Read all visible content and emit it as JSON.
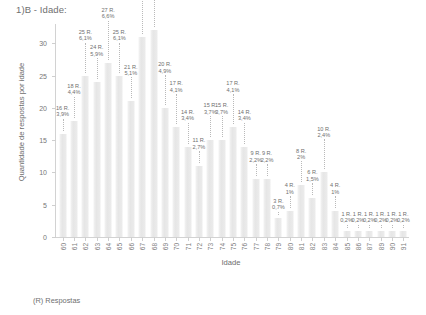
{
  "page": {
    "title": "1)B - Idade:",
    "footer_note": "(R) Respostas"
  },
  "chart_data": {
    "type": "bar",
    "title": "1)B - Idade:",
    "xlabel": "Idade",
    "ylabel": "Quantidade de respostas por idade",
    "ylim": [
      0,
      33
    ],
    "yticks": [
      0,
      5,
      10,
      15,
      20,
      25,
      30
    ],
    "grid": false,
    "legend": null,
    "categories": [
      "60",
      "61",
      "62",
      "63",
      "64",
      "65",
      "66",
      "67",
      "68",
      "69",
      "70",
      "71",
      "72",
      "73",
      "74",
      "75",
      "76",
      "77",
      "78",
      "79",
      "80",
      "81",
      "82",
      "83",
      "84",
      "85",
      "86",
      "87",
      "89",
      "90",
      "91"
    ],
    "values": [
      16,
      18,
      25,
      24,
      27,
      25,
      21,
      31,
      32,
      20,
      17,
      14,
      11,
      15,
      15,
      17,
      14,
      9,
      9,
      3,
      4,
      8,
      6,
      10,
      4,
      1,
      1,
      1,
      1,
      1,
      1
    ],
    "labels": [
      {
        "count": "16 R.",
        "pct": "3,9%"
      },
      {
        "count": "18 R.",
        "pct": "4,4%"
      },
      {
        "count": "25 R.",
        "pct": "6,1%"
      },
      {
        "count": "24 R.",
        "pct": "5,9%"
      },
      {
        "count": "27 R.",
        "pct": "6,6%"
      },
      {
        "count": "25 R.",
        "pct": "6,1%"
      },
      {
        "count": "21 R.",
        "pct": "5,1%"
      },
      {
        "count": "31 R.",
        "pct": "7,6%"
      },
      {
        "count": "32 R.",
        "pct": "7,8%"
      },
      {
        "count": "20 R.",
        "pct": "4,9%"
      },
      {
        "count": "17 R.",
        "pct": "4,1%"
      },
      {
        "count": "14 R.",
        "pct": "3,4%"
      },
      {
        "count": "11 R.",
        "pct": "2,7%"
      },
      {
        "count": "15 R.",
        "pct": "3,7%"
      },
      {
        "count": "15 R.",
        "pct": "3,7%"
      },
      {
        "count": "17 R.",
        "pct": "4,1%"
      },
      {
        "count": "14 R.",
        "pct": "3,4%"
      },
      {
        "count": "9 R.",
        "pct": "2,2%"
      },
      {
        "count": "9 R.",
        "pct": "2,2%"
      },
      {
        "count": "3 R.",
        "pct": "0,7%"
      },
      {
        "count": "4 R.",
        "pct": "1%"
      },
      {
        "count": "8 R.",
        "pct": "2%"
      },
      {
        "count": "6 R.",
        "pct": "1,5%"
      },
      {
        "count": "10 R.",
        "pct": "2,4%"
      },
      {
        "count": "4 R.",
        "pct": "1%"
      },
      {
        "count": "1 R.",
        "pct": "0,2%"
      },
      {
        "count": "1 R.",
        "pct": "0,2%"
      },
      {
        "count": "1 R.",
        "pct": "0,2%"
      },
      {
        "count": "1 R.",
        "pct": "0,2%"
      },
      {
        "count": "1 R.",
        "pct": "0,2%"
      },
      {
        "count": "1 R.",
        "pct": "0,2%"
      }
    ],
    "label_tiers": [
      1,
      2,
      3,
      2,
      4,
      3,
      2,
      5,
      6,
      3,
      3,
      2,
      1,
      2,
      2,
      3,
      2,
      1,
      1,
      0,
      1,
      2,
      1,
      3,
      1,
      0,
      0,
      0,
      0,
      0,
      0
    ],
    "bar_color": "#eaeaea",
    "axis_color": "#d2d2d2",
    "text_color": "#6f6f6f"
  }
}
